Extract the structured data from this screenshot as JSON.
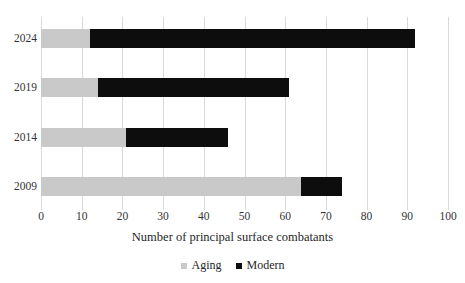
{
  "chart_data": {
    "type": "bar",
    "orientation": "horizontal",
    "stacked": true,
    "title": "",
    "xlabel": "Number of principal surface combatants",
    "ylabel": "",
    "xlim": [
      0,
      100
    ],
    "xticks": [
      0,
      10,
      20,
      30,
      40,
      50,
      60,
      70,
      80,
      90,
      100
    ],
    "xtick_labels": [
      "0",
      "10",
      "20",
      "30",
      "40",
      "50",
      "60",
      "70",
      "80",
      "90",
      "100"
    ],
    "categories": [
      "2024",
      "2019",
      "2014",
      "2009"
    ],
    "grid": "vertical",
    "legend_position": "bottom",
    "series": [
      {
        "name": "Aging",
        "color": "#c9c9c9",
        "values": [
          12,
          14,
          21,
          64
        ]
      },
      {
        "name": "Modern",
        "color": "#0d0d0d",
        "values": [
          80,
          47,
          25,
          10
        ]
      }
    ],
    "totals": [
      92,
      61,
      46,
      74
    ]
  },
  "legend": {
    "items": [
      {
        "label": "Aging",
        "color": "#c9c9c9"
      },
      {
        "label": "Modern",
        "color": "#0d0d0d"
      }
    ]
  }
}
